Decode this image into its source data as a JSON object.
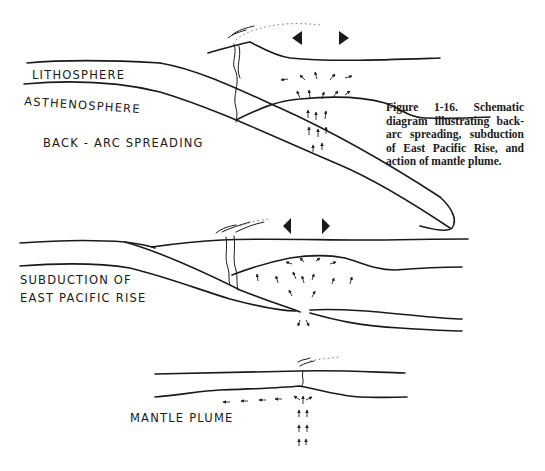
{
  "figure": {
    "caption": "Figure 1-16. Schematic diagram illustrating back-arc spreading, subduction of East Pacific Rise, and action of mantle plume.",
    "panels": [
      {
        "id": "back-arc-spreading",
        "title": "BACK - ARC  SPREADING",
        "layer_labels": {
          "lithosphere": "LITHOSPHERE",
          "asthenosphere": "ASTHENOSPHERE"
        }
      },
      {
        "id": "subduction-east-pacific-rise",
        "title_line1": "SUBDUCTION  OF",
        "title_line2": "EAST  PACIFIC  RISE"
      },
      {
        "id": "mantle-plume",
        "title": "MANTLE  PLUME"
      }
    ],
    "icons": [
      "volcano-icon",
      "spreading-arrows-icon",
      "convection-arrows-icon"
    ]
  }
}
